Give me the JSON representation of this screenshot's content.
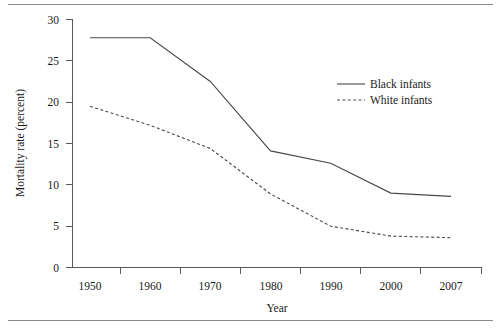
{
  "chart_data": {
    "type": "line",
    "title": "",
    "xlabel": "Year",
    "ylabel": "Mortality rate (percent)",
    "categories": [
      "1950",
      "1960",
      "1970",
      "1980",
      "1990",
      "2000",
      "2007"
    ],
    "x": [
      1950,
      1960,
      1970,
      1980,
      1990,
      2000,
      2007
    ],
    "xlim": [
      1945,
      2012
    ],
    "ylim": [
      0,
      30
    ],
    "yticks": [
      0,
      5,
      10,
      15,
      20,
      25,
      30
    ],
    "xticks": [
      "1950",
      "1960",
      "1970",
      "1980",
      "1990",
      "2000",
      "2007"
    ],
    "grid": false,
    "legend_position": "upper-right-inside",
    "series": [
      {
        "name": "Black infants",
        "style": "solid",
        "color": "#4a4a4a",
        "values": [
          27.8,
          27.8,
          22.5,
          14.1,
          12.6,
          9.0,
          8.6
        ]
      },
      {
        "name": "White infants",
        "style": "dashed",
        "color": "#4a4a4a",
        "values": [
          19.5,
          17.2,
          14.4,
          8.9,
          5.0,
          3.8,
          3.6
        ]
      }
    ]
  },
  "figure": {
    "top_rule": "horizontal-rule",
    "bottom_rule": "horizontal-rule"
  }
}
